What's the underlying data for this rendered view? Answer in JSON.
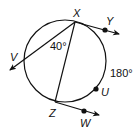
{
  "diagram": {
    "type": "circle-geometry",
    "points": {
      "X": "X",
      "Y": "Y",
      "V": "V",
      "Z": "Z",
      "W": "W",
      "U": "U"
    },
    "angles": {
      "inscribed_angle": "40°",
      "arc_measure": "180°"
    },
    "colors": {
      "stroke": "#111111",
      "background": "#ffffff"
    }
  }
}
